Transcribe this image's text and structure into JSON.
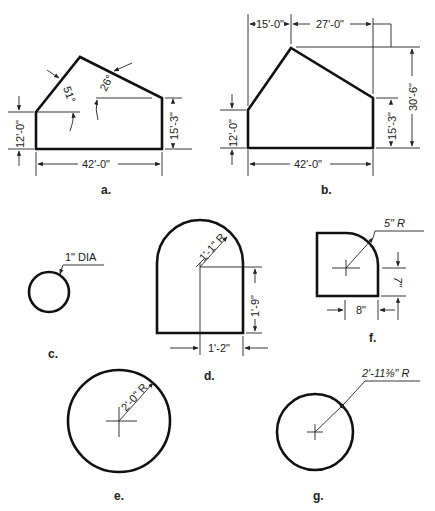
{
  "figures": {
    "a": {
      "caption": "a.",
      "angle_left": "51°",
      "angle_right": "26°",
      "left_height": "12'-0\"",
      "right_height": "15'-3\"",
      "width": "42'-0\""
    },
    "b": {
      "caption": "b.",
      "top_left": "15'-0\"",
      "top_right": "27'-0\"",
      "total_height": "30'-6\"",
      "left_height": "12'-0\"",
      "right_height": "15'-3\"",
      "width": "42'-0\""
    },
    "c": {
      "caption": "c.",
      "diameter": "1\" DIA"
    },
    "d": {
      "caption": "d.",
      "radius": "1'-1\" R",
      "height": "1'-9\"",
      "width": "1'-2\""
    },
    "e": {
      "caption": "e.",
      "radius": "2'-0\" R"
    },
    "f": {
      "caption": "f.",
      "radius": "5\" R",
      "height": "7\"",
      "width": "8\""
    },
    "g": {
      "caption": "g.",
      "radius": "2'-11⅜\" R"
    }
  }
}
